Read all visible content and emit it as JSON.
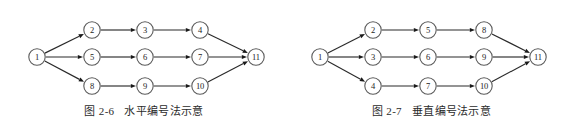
{
  "figures": [
    {
      "id": "figure-2-6",
      "caption_number": "图 2-6",
      "caption_text": "水平编号法示意",
      "numbering_scheme": "horizontal",
      "nodes": [
        {
          "label": "1",
          "x": 37,
          "y": 57
        },
        {
          "label": "2",
          "x": 92,
          "y": 30
        },
        {
          "label": "3",
          "x": 145,
          "y": 30
        },
        {
          "label": "4",
          "x": 200,
          "y": 30
        },
        {
          "label": "5",
          "x": 92,
          "y": 57
        },
        {
          "label": "6",
          "x": 145,
          "y": 57
        },
        {
          "label": "7",
          "x": 200,
          "y": 57
        },
        {
          "label": "8",
          "x": 92,
          "y": 86
        },
        {
          "label": "9",
          "x": 145,
          "y": 86
        },
        {
          "label": "10",
          "x": 200,
          "y": 86
        },
        {
          "label": "11",
          "x": 256,
          "y": 57
        }
      ],
      "edges": [
        {
          "from": "1",
          "to": "2"
        },
        {
          "from": "1",
          "to": "5"
        },
        {
          "from": "1",
          "to": "8"
        },
        {
          "from": "2",
          "to": "3"
        },
        {
          "from": "3",
          "to": "4"
        },
        {
          "from": "5",
          "to": "6"
        },
        {
          "from": "6",
          "to": "7"
        },
        {
          "from": "8",
          "to": "9"
        },
        {
          "from": "9",
          "to": "10"
        },
        {
          "from": "4",
          "to": "11"
        },
        {
          "from": "7",
          "to": "11"
        },
        {
          "from": "10",
          "to": "11"
        }
      ]
    },
    {
      "id": "figure-2-7",
      "caption_number": "图 2-7",
      "caption_text": "垂直编号法示意",
      "numbering_scheme": "vertical",
      "nodes": [
        {
          "label": "1",
          "x": 32,
          "y": 57
        },
        {
          "label": "2",
          "x": 85,
          "y": 30
        },
        {
          "label": "5",
          "x": 140,
          "y": 30
        },
        {
          "label": "8",
          "x": 196,
          "y": 30
        },
        {
          "label": "3",
          "x": 85,
          "y": 57
        },
        {
          "label": "6",
          "x": 140,
          "y": 57
        },
        {
          "label": "9",
          "x": 196,
          "y": 57
        },
        {
          "label": "4",
          "x": 85,
          "y": 86
        },
        {
          "label": "7",
          "x": 140,
          "y": 86
        },
        {
          "label": "10",
          "x": 196,
          "y": 86
        },
        {
          "label": "11",
          "x": 250,
          "y": 57
        }
      ],
      "edges": [
        {
          "from": "1",
          "to": "2"
        },
        {
          "from": "1",
          "to": "3"
        },
        {
          "from": "1",
          "to": "4"
        },
        {
          "from": "2",
          "to": "5"
        },
        {
          "from": "5",
          "to": "8"
        },
        {
          "from": "3",
          "to": "6"
        },
        {
          "from": "6",
          "to": "9"
        },
        {
          "from": "4",
          "to": "7"
        },
        {
          "from": "7",
          "to": "10"
        },
        {
          "from": "8",
          "to": "11"
        },
        {
          "from": "9",
          "to": "11"
        },
        {
          "from": "10",
          "to": "11"
        }
      ]
    }
  ],
  "style": {
    "background": "#ffffff",
    "node_radius": 8.2,
    "node_fill": "#ffffff",
    "node_stroke": "#5a5a5a",
    "edge_color": "#2a2a2a",
    "text_color": "#1c1c1c"
  }
}
